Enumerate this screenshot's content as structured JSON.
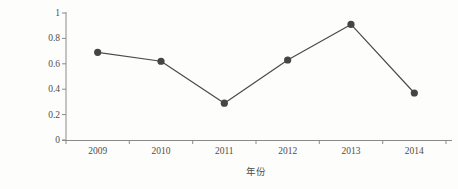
{
  "chart_data": {
    "type": "line",
    "title": "",
    "xlabel": "年份",
    "ylabel": "无机氮含量（mg/L）",
    "categories": [
      "2009",
      "2010",
      "2011",
      "2012",
      "2013",
      "2014"
    ],
    "values": [
      0.69,
      0.62,
      0.29,
      0.63,
      0.91,
      0.37
    ],
    "series": [
      {
        "name": "无机氮含量",
        "values": [
          0.69,
          0.62,
          0.29,
          0.63,
          0.91,
          0.37
        ]
      }
    ],
    "ylim": [
      0,
      1
    ],
    "ytick_labels": [
      "0",
      "0.2",
      "0.4",
      "0.6",
      "0.8",
      "1"
    ],
    "ytick_values": [
      0,
      0.2,
      0.4,
      0.6,
      0.8,
      1
    ],
    "xtick_labels": [
      "2009",
      "2010",
      "2011",
      "2012",
      "2013",
      "2014"
    ],
    "grid": false,
    "legend": "none",
    "marker": "circle",
    "line_color": "#4a4a4a",
    "marker_color": "#454545",
    "axis_color": "#8a8a8a"
  }
}
